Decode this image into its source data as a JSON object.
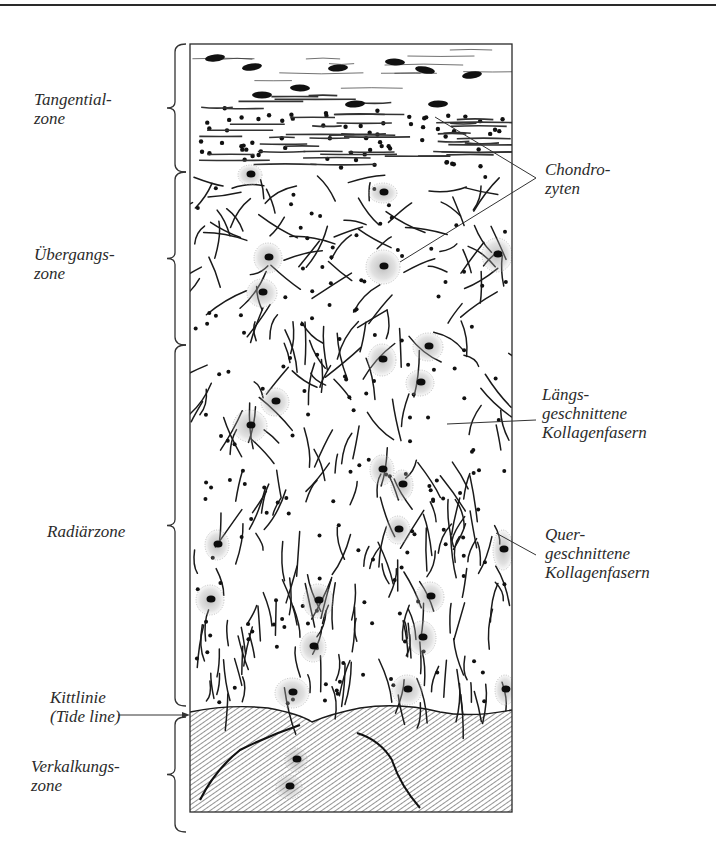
{
  "figure": {
    "frame": {
      "x": 190,
      "y": 44,
      "width": 322,
      "height": 768
    },
    "tide_line_y": 712,
    "colors": {
      "ink": "#1a1a1a",
      "stipple": "#555555",
      "paper": "#ffffff",
      "hatch": "#3a3a3a"
    }
  },
  "zones_left": [
    {
      "id": "tangential",
      "lines": [
        "Tangential-",
        "zone"
      ],
      "brace": [
        44,
        172
      ],
      "label_x": 34,
      "label_y": 90
    },
    {
      "id": "uebergang",
      "lines": [
        "Übergangs-",
        "zone"
      ],
      "brace": [
        172,
        345
      ],
      "label_x": 34,
      "label_y": 245
    },
    {
      "id": "radiaer",
      "lines": [
        "Radiärzone"
      ],
      "brace": [
        345,
        706
      ],
      "label_x": 47,
      "label_y": 522
    },
    {
      "id": "kittlinie",
      "lines": [
        "Kittlinie",
        "(Tide line)"
      ],
      "label_x": 50,
      "label_y": 688
    },
    {
      "id": "verkalkung",
      "lines": [
        "Verkalkungs-",
        "zone"
      ],
      "brace": [
        717,
        832
      ],
      "label_x": 31,
      "label_y": 757
    }
  ],
  "annotations_right": [
    {
      "id": "chondrozyten",
      "lines": [
        "Chondro-",
        "zyten"
      ],
      "label_x": 545,
      "label_y": 160
    },
    {
      "id": "laengs",
      "lines": [
        "Längs-",
        "geschnittene",
        "Kollagenfasern"
      ],
      "label_x": 542,
      "label_y": 385
    },
    {
      "id": "quer",
      "lines": [
        "Quer-",
        "geschnittene",
        "Kollagenfasern"
      ],
      "label_x": 545,
      "label_y": 525
    }
  ]
}
